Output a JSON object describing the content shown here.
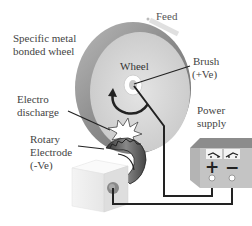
{
  "labels": {
    "feed": "Feed",
    "specific_wheel_line1": "Specific metal",
    "specific_wheel_line2": "bonded wheel",
    "wheel": "Wheel",
    "brush_line1": "Brush",
    "brush_line2": "(+Ve)",
    "electro_line1": "Electro",
    "electro_line2": "discharge",
    "rotary_line1": "Rotary",
    "rotary_line2": "Electrode",
    "rotary_line3": "(-Ve)",
    "power_line1": "Power",
    "power_line2": "supply",
    "plus_sign": "+",
    "minus_sign": "−"
  },
  "icons": [
    "feed-arrow-icon",
    "rotation-arrow-icon",
    "spark-icon",
    "switch-icon-left",
    "switch-icon-right"
  ]
}
